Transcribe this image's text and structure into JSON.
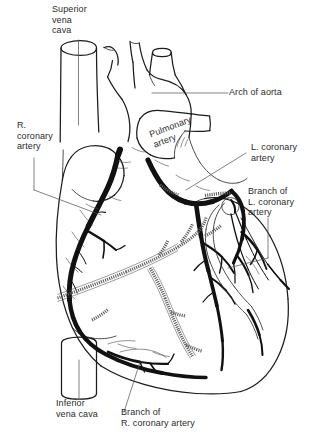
{
  "figure": {
    "background_color": "#ffffff",
    "ink_color": "#1c1c1c",
    "vessel_color": "#111111",
    "hidden_vessel_color": "#5d5d5d",
    "leader_color": "#4e4e4e"
  },
  "labels": {
    "superior_vena_cava": {
      "line1": "Superior",
      "line2": "vena",
      "line3": "cava"
    },
    "arch_of_aorta": {
      "line1": "Arch of aorta"
    },
    "pulmonary_artery": {
      "line1": "Pulmonary",
      "line2": "artery"
    },
    "r_coronary_artery": {
      "line1": "R.",
      "line2": "coronary",
      "line3": "artery"
    },
    "l_coronary_artery": {
      "line1": "L. coronary",
      "line2": "artery"
    },
    "branch_l_coronary_artery": {
      "line1": "Branch of",
      "line2": "L. coronary",
      "line3": "artery"
    },
    "inferior_vena_cava": {
      "line1": "Inferior",
      "line2": "vena cava"
    },
    "branch_r_coronary_artery": {
      "line1": "Branch of",
      "line2": "R. coronary artery"
    }
  }
}
